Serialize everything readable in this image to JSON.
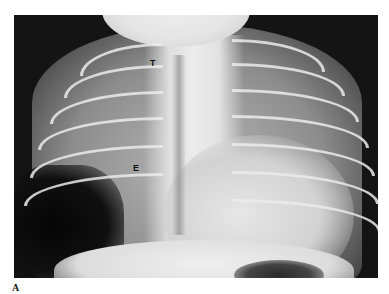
{
  "figure": {
    "type": "chest radiograph",
    "panel_label": "A",
    "annotations": [
      {
        "id": "T",
        "text": "T",
        "x": 153,
        "y": 64
      },
      {
        "id": "E",
        "text": "E",
        "x": 136,
        "y": 169
      }
    ],
    "colors": {
      "background": "#ffffff",
      "film_dark": "#141414",
      "bone_light": "#ebebeb",
      "label": "#111111"
    }
  }
}
